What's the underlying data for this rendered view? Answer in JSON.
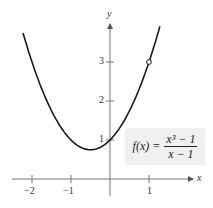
{
  "chart_data": {
    "type": "line",
    "title": "",
    "function_label": "f(x) = (x^3 - 1)/(x - 1)",
    "formula": {
      "lhs": "f(x) =",
      "numerator": "x³ − 1",
      "denominator": "x − 1"
    },
    "xlabel": "x",
    "ylabel": "y",
    "x_ticks": [
      "-2",
      "-1",
      "1"
    ],
    "y_ticks": [
      "1",
      "2",
      "3"
    ],
    "xlim": [
      -2.4,
      2.1
    ],
    "ylim": [
      -0.5,
      4.0
    ],
    "grid": false,
    "series": [
      {
        "name": "f(x) = x^2 + x + 1 (x ≠ 1)",
        "x": [
          -2.23,
          -2.0,
          -1.5,
          -1.0,
          -0.5,
          0.0,
          0.5,
          1.0,
          1.28
        ],
        "y": [
          3.74,
          3.0,
          1.75,
          1.0,
          0.75,
          1.0,
          1.75,
          3.0,
          3.92
        ]
      }
    ],
    "annotations": [
      {
        "type": "open-circle",
        "x": 1,
        "y": 3,
        "note": "hole at x = 1"
      }
    ],
    "colors": {
      "curve": "#1a1a1a",
      "axis": "#555555",
      "formula_bg": "#f0f0f0"
    }
  },
  "axis_labels": {
    "x": "x",
    "y": "y"
  },
  "ticks": {
    "x": [
      {
        "label": "−2"
      },
      {
        "label": "−1"
      },
      {
        "label": "1"
      }
    ],
    "y": [
      {
        "label": "1"
      },
      {
        "label": "2"
      },
      {
        "label": "3"
      }
    ]
  }
}
